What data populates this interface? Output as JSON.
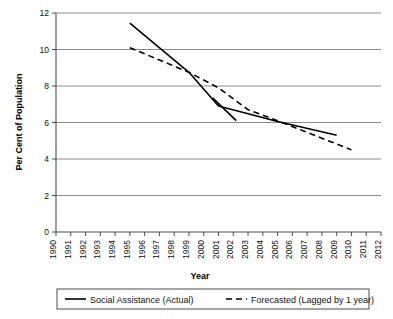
{
  "chart_data": {
    "type": "line",
    "title": "",
    "xlabel": "Year",
    "ylabel": "Per Cent of Population",
    "ylim": [
      0,
      12
    ],
    "ytick_values": [
      0,
      2,
      4,
      6,
      8,
      10,
      12
    ],
    "ytick_labels": [
      "0",
      "2",
      "4",
      "6",
      "8",
      "10",
      "12"
    ],
    "xlim": [
      1990,
      2012
    ],
    "x_categories": [
      "1990",
      "1991",
      "1992",
      "1993",
      "1994",
      "1995",
      "1996",
      "1997",
      "1998",
      "1999",
      "2000",
      "2001",
      "2002",
      "2003",
      "2004",
      "2005",
      "2006",
      "2007",
      "2008",
      "2009",
      "2010",
      "2011",
      "2012"
    ],
    "grid": "horizontal",
    "legend_position": "bottom",
    "series": [
      {
        "name": "Social Assistance (Actual)",
        "style": "solid",
        "color": "#000000",
        "x": [
          1995,
          1999,
          2001,
          2005,
          2009
        ],
        "values": [
          11.45,
          8.75,
          6.9,
          6.05,
          5.3
        ]
      },
      {
        "name": "Forecasted (Lagged by 1 year)",
        "style": "dashed",
        "color": "#000000",
        "x": [
          1995,
          1999,
          2001,
          2003,
          2005,
          2010
        ],
        "values": [
          10.1,
          8.75,
          7.9,
          6.7,
          6.1,
          4.5
        ]
      },
      {
        "name": "Social Assistance (Actual) branch",
        "style": "solid",
        "color": "#000000",
        "x": [
          2000.6,
          2002.2
        ],
        "values": [
          7.35,
          6.1
        ]
      }
    ]
  },
  "legend": {
    "entries": [
      {
        "label": "Social Assistance (Actual)",
        "style": "solid"
      },
      {
        "label": "Forecasted (Lagged by 1 year)",
        "style": "dashed"
      }
    ]
  },
  "colors": {
    "axis": "#4d4d4d",
    "grid": "#808080",
    "line": "#000000",
    "text": "#111111",
    "legend_border": "#4d4d4d"
  }
}
